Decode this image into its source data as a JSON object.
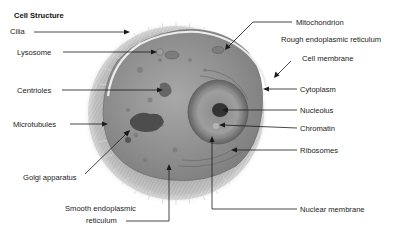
{
  "title": "Cell Structure",
  "labels": {
    "cilia": "Cilia",
    "lysosome": "Lysosome",
    "centrioles": "Centrioles",
    "microtubules": "Microtubules",
    "golgi": "Golgi apparatus",
    "smooth_er_line1": "Smooth endoplasmic",
    "smooth_er_line2": "reticulum",
    "mitochondrion": "Mitochondrion",
    "rough_er": "Rough endoplasmic reticulum",
    "cell_membrane": "Cell membrane",
    "cytoplasm": "Cytoplasm",
    "nucleolus": "Nucleolus",
    "chromatin": "Chromatin",
    "ribosomes": "Ribosomes",
    "nuclear_membrane": "Nuclear membrane"
  },
  "colors": {
    "background": "#ffffff",
    "text": "#222222",
    "leader_line": "#1a1a1a",
    "cilia": "#b8b8b8",
    "cytoplasm": "#8f8f8f",
    "membrane": "#e8e8e8",
    "nucleus": "#7a7a7a",
    "nucleolus": "#333333",
    "golgi": "#4a4a4a"
  }
}
